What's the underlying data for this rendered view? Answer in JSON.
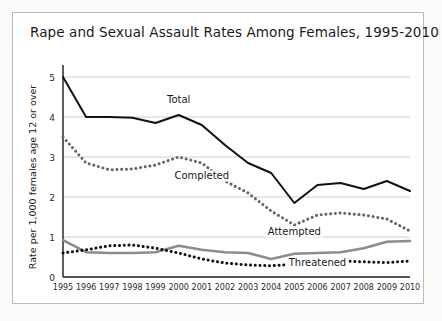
{
  "figure": {
    "background_color": "#fbfbfa",
    "panel_color": "#ffffff",
    "border_color": "#b9b9b9"
  },
  "chart_data": {
    "type": "line",
    "title": "Rape and Sexual Assault Rates Among Females, 1995-2010",
    "xlabel": "",
    "ylabel": "Rate per 1,000 females age 12 or over",
    "categories": [
      "1995",
      "1996",
      "1997",
      "1998",
      "1999",
      "2000",
      "2001",
      "2002",
      "2003",
      "2004",
      "2005",
      "2006",
      "2007",
      "2008",
      "2009",
      "2010"
    ],
    "x": [
      1995,
      1996,
      1997,
      1998,
      1999,
      2000,
      2001,
      2002,
      2003,
      2004,
      2005,
      2006,
      2007,
      2008,
      2009,
      2010
    ],
    "ylim": [
      0,
      5
    ],
    "yticks": [
      0,
      1,
      2,
      3,
      4,
      5
    ],
    "ytick_labels": [
      "0",
      "1",
      "2",
      "3",
      "4",
      "5"
    ],
    "grid": true,
    "legend": "inline-labels",
    "series": [
      {
        "name": "Total",
        "style": "solid",
        "color": "#111111",
        "width": 2.0,
        "label_x": 2000,
        "label_y": 4.35,
        "values": [
          5.0,
          4.0,
          4.0,
          3.98,
          3.85,
          4.05,
          3.8,
          3.3,
          2.85,
          2.6,
          1.85,
          2.3,
          2.35,
          2.2,
          2.4,
          2.15
        ]
      },
      {
        "name": "Completed",
        "style": "dotted",
        "color": "#666666",
        "width": 3.0,
        "label_x": 2001,
        "label_y": 2.45,
        "values": [
          3.5,
          2.85,
          2.68,
          2.7,
          2.8,
          3.0,
          2.85,
          2.4,
          2.1,
          1.65,
          1.3,
          1.55,
          1.6,
          1.55,
          1.45,
          1.15
        ]
      },
      {
        "name": "Attempted",
        "style": "solid",
        "color": "#8c8c8c",
        "width": 2.6,
        "label_x": 2005,
        "label_y": 1.05,
        "values": [
          0.92,
          0.62,
          0.6,
          0.6,
          0.62,
          0.78,
          0.68,
          0.62,
          0.6,
          0.45,
          0.58,
          0.6,
          0.62,
          0.72,
          0.88,
          0.9
        ]
      },
      {
        "name": "Threatened",
        "style": "dotted",
        "color": "#111111",
        "width": 3.0,
        "label_x": 2006,
        "label_y": 0.28,
        "values": [
          0.6,
          0.68,
          0.78,
          0.8,
          0.72,
          0.6,
          0.45,
          0.35,
          0.3,
          0.28,
          0.32,
          0.38,
          0.4,
          0.38,
          0.36,
          0.4
        ]
      }
    ]
  }
}
